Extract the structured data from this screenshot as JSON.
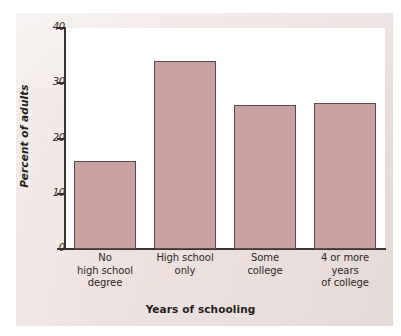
{
  "chart_data": {
    "type": "bar",
    "title": "",
    "subtitle": "",
    "xlabel": "Years of schooling",
    "ylabel": "Percent of adults",
    "categories": [
      "No\nhigh school\ndegree",
      "High school\nonly",
      "Some\ncollege",
      "4 or more\nyears\nof college"
    ],
    "category_lines": [
      [
        "No",
        "high school",
        "degree"
      ],
      [
        "High school",
        "only"
      ],
      [
        "Some",
        "college"
      ],
      [
        "4 or more",
        "years",
        "of college"
      ]
    ],
    "values": [
      16,
      34,
      26,
      26.5
    ],
    "ylim": [
      0,
      40
    ],
    "yticks": [
      0,
      10,
      20,
      30,
      40
    ],
    "ytick_labels": [
      "0",
      "10",
      "20",
      "30",
      "40"
    ],
    "grid": false,
    "legend": false,
    "legend_position": "none",
    "bar_color": "#c8a2a0",
    "bar_edge_color": "#5a4b49",
    "axis_color": "#3a3330",
    "plot_background": "#ffffff",
    "page_background": "#efe3e0"
  },
  "figure": {
    "x_axis_title": "Years of schooling",
    "y_axis_title": "Percent of adults"
  }
}
